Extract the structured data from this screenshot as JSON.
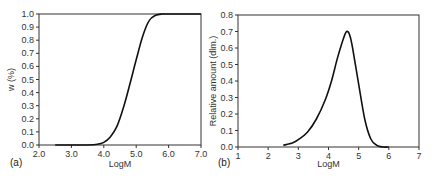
{
  "chart_data": [
    {
      "type": "line",
      "panel_label": "(a)",
      "title": "",
      "xlabel": "LogM",
      "ylabel": "w (%)",
      "xlim": [
        2.0,
        7.0
      ],
      "ylim": [
        0.0,
        1.0
      ],
      "xticks": [
        "2.0",
        "3.0",
        "4.0",
        "5.0",
        "6.0",
        "7.0"
      ],
      "yticks": [
        "0.0",
        "0.1",
        "0.2",
        "0.3",
        "0.4",
        "0.5",
        "0.6",
        "0.7",
        "0.8",
        "0.9",
        "1.0"
      ],
      "grid": false,
      "legend": null,
      "series": [
        {
          "name": "cumulative distribution",
          "x": [
            2.5,
            3.0,
            3.5,
            3.8,
            4.0,
            4.2,
            4.4,
            4.6,
            4.8,
            5.0,
            5.2,
            5.4,
            5.6,
            5.8,
            6.0,
            7.0
          ],
          "y": [
            0.0,
            0.0,
            0.0,
            0.005,
            0.02,
            0.06,
            0.14,
            0.28,
            0.46,
            0.65,
            0.83,
            0.95,
            0.99,
            1.0,
            1.0,
            1.0
          ]
        }
      ]
    },
    {
      "type": "line",
      "panel_label": "(b)",
      "title": "",
      "xlabel": "LogM",
      "ylabel": "Relative amount (dlm.)",
      "xlim": [
        1,
        7
      ],
      "ylim": [
        0.0,
        0.8
      ],
      "xticks": [
        "1",
        "2",
        "3",
        "4",
        "5",
        "6",
        "7"
      ],
      "yticks": [
        "0.0",
        "0.1",
        "0.2",
        "0.3",
        "0.4",
        "0.5",
        "0.6",
        "0.7",
        "0.8"
      ],
      "grid": false,
      "legend": null,
      "series": [
        {
          "name": "molecular weight distribution",
          "x": [
            2.5,
            2.8,
            3.0,
            3.3,
            3.6,
            3.9,
            4.1,
            4.3,
            4.5,
            4.6,
            4.7,
            4.8,
            5.0,
            5.2,
            5.4,
            5.6,
            5.8,
            6.0
          ],
          "y": [
            0.01,
            0.025,
            0.045,
            0.09,
            0.17,
            0.29,
            0.4,
            0.54,
            0.66,
            0.7,
            0.68,
            0.6,
            0.38,
            0.17,
            0.05,
            0.01,
            0.0,
            0.0
          ]
        }
      ]
    }
  ]
}
